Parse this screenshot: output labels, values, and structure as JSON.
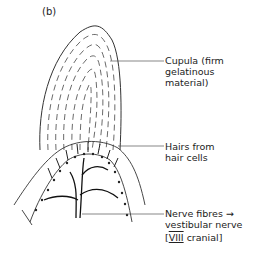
{
  "figure": {
    "panel_label": "(b)"
  },
  "labels": {
    "cupula": {
      "line1": "Cupula (firm",
      "line2": "gelatinous",
      "line3": "material)"
    },
    "hairs": {
      "line1": "Hairs from",
      "line2": "hair cells"
    },
    "nerve": {
      "line1": "Nerve fibres →",
      "line2": "vestibular nerve",
      "line3_bracket_open": "[",
      "line3_numeral": "VIII",
      "line3_text": " cranial",
      "line3_bracket_close": "]"
    }
  }
}
